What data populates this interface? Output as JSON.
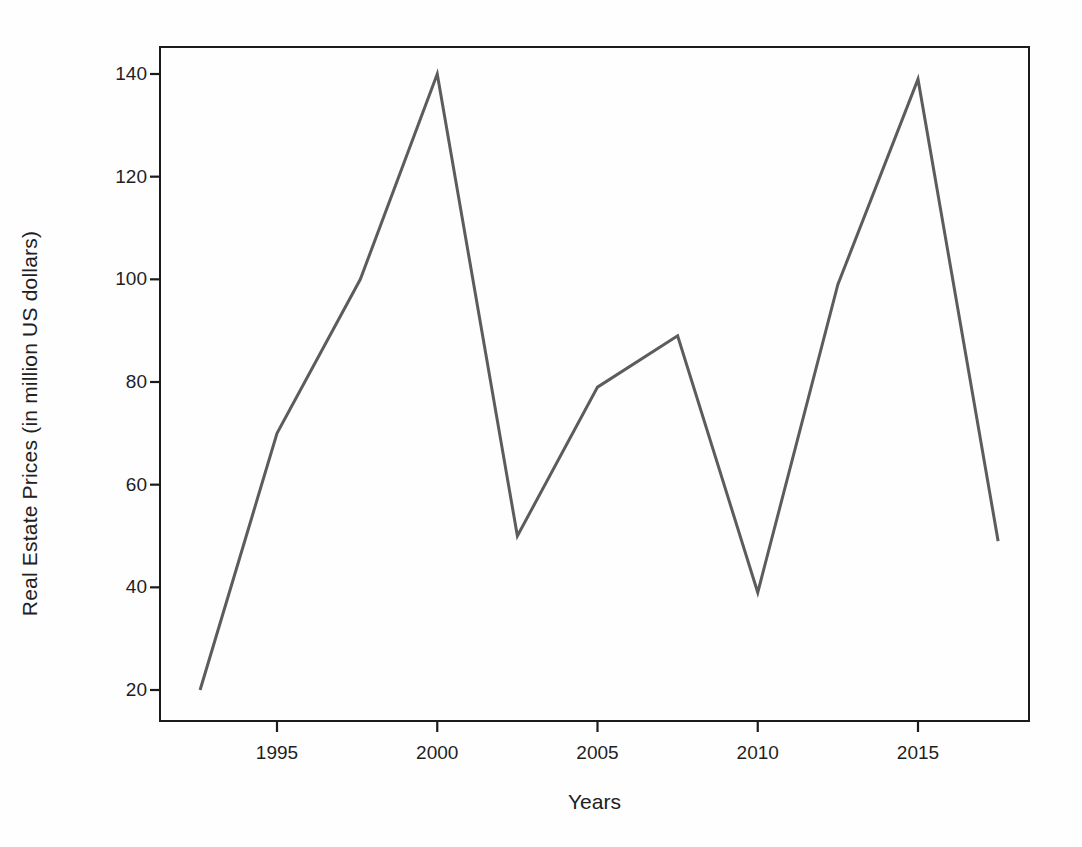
{
  "chart_data": {
    "type": "line",
    "title": "",
    "xlabel": "Years",
    "ylabel": "Real Estate Prices (in million US dollars)",
    "xlim": [
      1992.4,
      1999.9
    ],
    "ylim": [
      13.5,
      145
    ],
    "xticks": [
      1995,
      2000,
      2005,
      2010,
      2015
    ],
    "xtick_labels": [
      "1995",
      "2000",
      "2005",
      "2010",
      "2015"
    ],
    "yticks": [
      20,
      40,
      60,
      80,
      100,
      120,
      140
    ],
    "ytick_labels": [
      "20",
      "40",
      "60",
      "80",
      "100",
      "120",
      "140"
    ],
    "grid": false,
    "legend": false,
    "series": [
      {
        "name": "Real Estate Prices",
        "color": "#5c5c5c",
        "line_width": 3,
        "x": [
          1992.6,
          1995.0,
          1997.6,
          2000.0,
          2002.5,
          2005.0,
          2007.5,
          2010.0,
          2012.5,
          2015.0,
          2017.5
        ],
        "values": [
          20,
          70,
          100,
          140,
          50,
          79,
          89,
          39,
          99,
          139,
          49
        ]
      }
    ]
  },
  "axes": {
    "frame_color": "#1b1b1b",
    "background": "#fefefe"
  }
}
